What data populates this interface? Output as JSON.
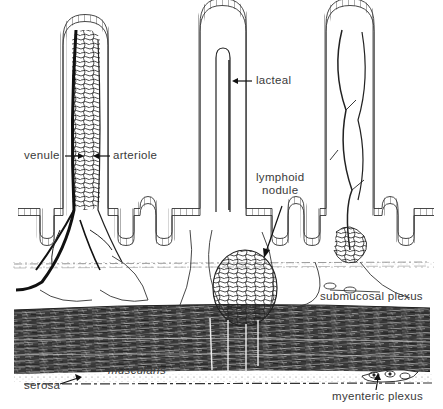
{
  "diagram": {
    "colors": {
      "ink": "#1c1c1c",
      "label_text": "#3a3a3a",
      "background": "#ffffff",
      "muscle_dark": "#2a2a2a"
    },
    "labels": {
      "venule": "venule",
      "arteriole": "arteriole",
      "lacteal": "lacteal",
      "lymphoid": "lymphoid",
      "nodule": "nodule",
      "submucosal_plexus": "submucosal plexus",
      "muscularis": "muscularis",
      "serosa": "serosa",
      "myenteric_plexus": "myenteric plexus"
    },
    "structures": [
      {
        "id": "villus-left",
        "description": "villus with venule and arteriole capillary network"
      },
      {
        "id": "villus-center",
        "description": "villus with central lacteal"
      },
      {
        "id": "villus-right",
        "description": "villus with vessel branches"
      },
      {
        "id": "lymphoid-nodule",
        "description": "lymphoid nodule in submucosa"
      },
      {
        "id": "submucosa",
        "description": "submucosal layer with plexus"
      },
      {
        "id": "muscularis-layer",
        "description": "dark muscular layer"
      },
      {
        "id": "serosa-layer",
        "description": "thin outer serosa"
      }
    ]
  }
}
